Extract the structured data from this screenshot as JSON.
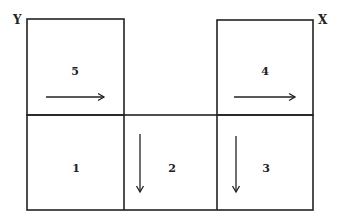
{
  "diagram": {
    "corner_labels": {
      "left": "Y",
      "right": "X"
    },
    "cells": [
      {
        "id": "cell-1",
        "label": "1",
        "arrow": "none"
      },
      {
        "id": "cell-2",
        "label": "2",
        "arrow": "down"
      },
      {
        "id": "cell-3",
        "label": "3",
        "arrow": "down"
      },
      {
        "id": "cell-4",
        "label": "4",
        "arrow": "right"
      },
      {
        "id": "cell-5",
        "label": "5",
        "arrow": "right"
      }
    ],
    "line_color": "#222222"
  }
}
